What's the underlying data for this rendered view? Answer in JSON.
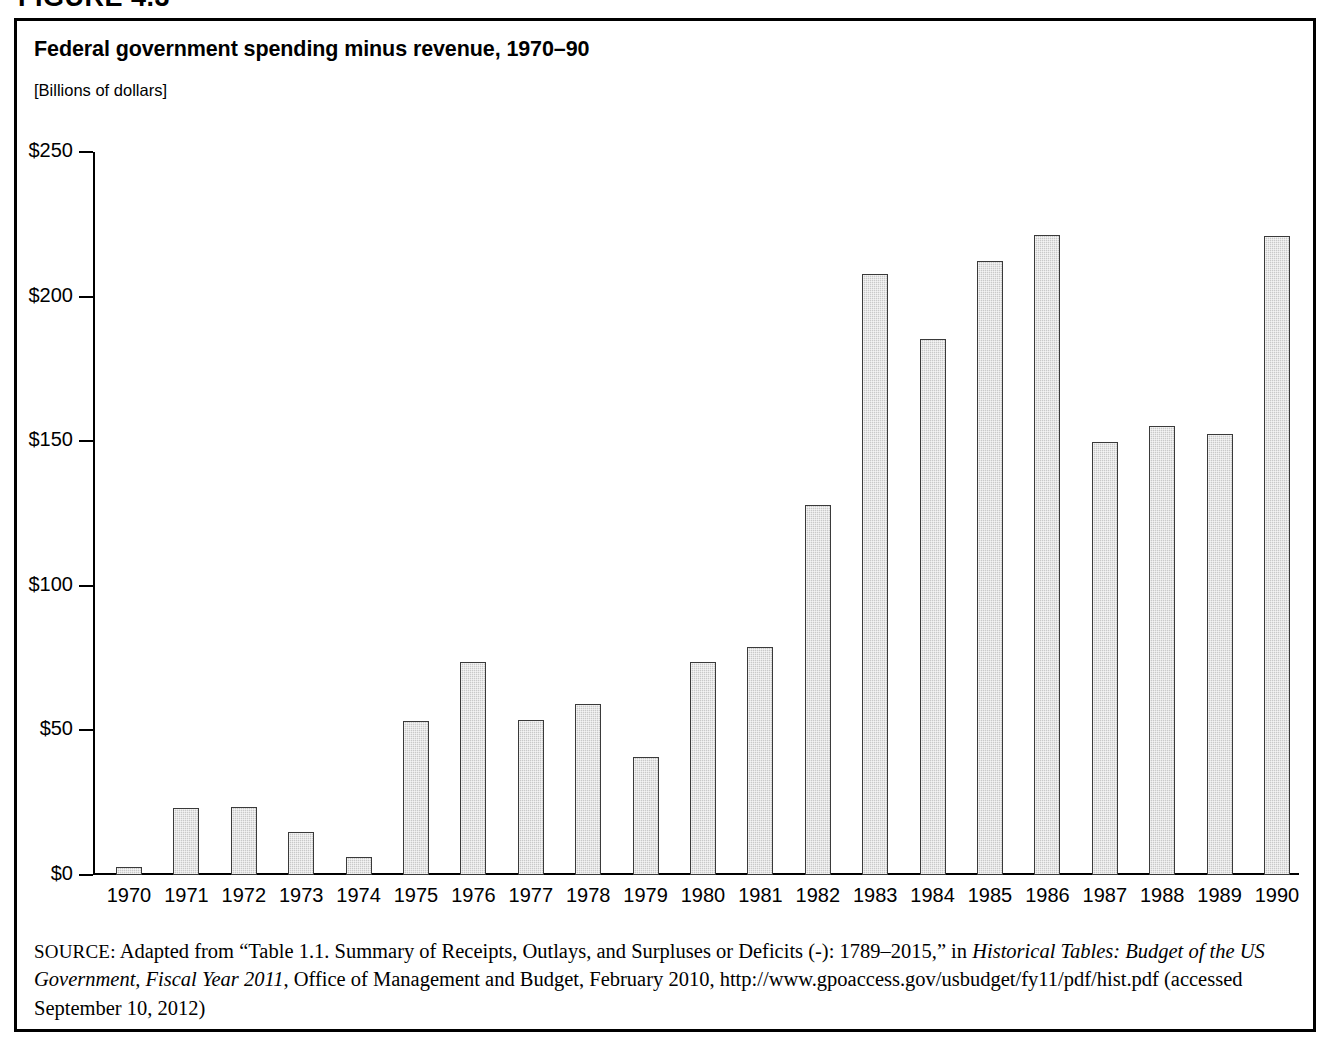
{
  "figure": {
    "label": "FIGURE 4.3"
  },
  "chart": {
    "title": "Federal government spending minus revenue, 1970–90",
    "units": "[Billions of dollars]"
  },
  "source": {
    "prefix": "SOURCE:",
    "part1": " Adapted from “Table 1.1. Summary of Receipts, Outlays, and Surpluses or Deficits (-): 1789–2015,” in ",
    "italic1": "Historical Tables: Budget of the US Government, Fiscal Year 2011",
    "part2": ", Office of Management and Budget, February 2010, http://www.gpoaccess.gov/usbudget/fy11/pdf/hist.pdf (accessed September 10, 2012)"
  },
  "chart_data": {
    "type": "bar",
    "title": "Federal government spending minus revenue, 1970–90",
    "subtitle": "[Billions of dollars]",
    "xlabel": "",
    "ylabel": "[Billions of dollars]",
    "ylim": [
      0,
      250
    ],
    "yticks": [
      0,
      50,
      100,
      150,
      200,
      250
    ],
    "ytick_labels": [
      "$0",
      "$50",
      "$100",
      "$150",
      "$200",
      "$250"
    ],
    "grid": false,
    "legend": null,
    "bar_fill": "#c9c9c9",
    "bar_edge": "#3a3a3a",
    "categories": [
      "1970",
      "1971",
      "1972",
      "1973",
      "1974",
      "1975",
      "1976",
      "1977",
      "1978",
      "1979",
      "1980",
      "1981",
      "1982",
      "1983",
      "1984",
      "1985",
      "1986",
      "1987",
      "1988",
      "1989",
      "1990"
    ],
    "values": [
      2.8,
      23.0,
      23.4,
      14.9,
      6.1,
      53.2,
      73.7,
      53.7,
      59.2,
      40.7,
      73.8,
      79.0,
      128.0,
      207.8,
      185.4,
      212.3,
      221.2,
      149.7,
      155.2,
      152.6,
      221.0
    ]
  }
}
